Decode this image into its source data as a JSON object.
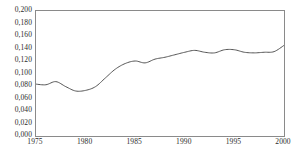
{
  "chart_data": {
    "type": "line",
    "title": "",
    "subtitle": "",
    "xlabel": "",
    "ylabel": "",
    "xlim": [
      1975,
      2000
    ],
    "ylim": [
      0.0,
      0.2
    ],
    "grid": false,
    "legend": false,
    "legend_position": "none",
    "decimal_separator": ",",
    "line_color": "#555555",
    "axis_color": "#8a8a8a",
    "background_color": "#ffffff",
    "ytick_labels": [
      "0,200",
      "0,180",
      "0,160",
      "0,140",
      "0,120",
      "0,100",
      "0,080",
      "0,060",
      "0,040",
      "0,020",
      "0,000"
    ],
    "ytick_values": [
      0.2,
      0.18,
      0.16,
      0.14,
      0.12,
      0.1,
      0.08,
      0.06,
      0.04,
      0.02,
      0.0
    ],
    "xtick_labels": [
      "1975",
      "1980",
      "1985",
      "1990",
      "1995",
      "2000"
    ],
    "xtick_values": [
      1975,
      1980,
      1985,
      1990,
      1995,
      2000
    ],
    "series": [
      {
        "name": "series-1",
        "color": "#555555",
        "x": [
          1975,
          1976,
          1977,
          1978,
          1979,
          1980,
          1981,
          1982,
          1983,
          1984,
          1985,
          1986,
          1987,
          1988,
          1989,
          1990,
          1991,
          1992,
          1993,
          1994,
          1995,
          1996,
          1997,
          1998,
          1999,
          2000
        ],
        "values": [
          0.083,
          0.082,
          0.087,
          0.079,
          0.072,
          0.073,
          0.079,
          0.093,
          0.107,
          0.116,
          0.12,
          0.117,
          0.123,
          0.126,
          0.13,
          0.134,
          0.137,
          0.134,
          0.133,
          0.138,
          0.138,
          0.134,
          0.133,
          0.134,
          0.135,
          0.145
        ]
      }
    ]
  }
}
